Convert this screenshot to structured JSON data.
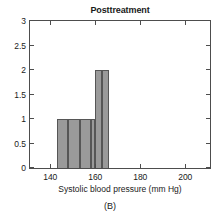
{
  "figure": {
    "panel_caption": "(B)",
    "background_color": "#ffffff",
    "axis_color": "#4d4d4d"
  },
  "chart_data": {
    "type": "bar",
    "title": "Posttreatment",
    "subtitle": "",
    "xlabel": "Systolic blood pressure (mm Hg)",
    "ylabel": "",
    "xlim": [
      131,
      211
    ],
    "ylim": [
      0,
      3
    ],
    "grid": false,
    "legend": null,
    "bar_fill_color": "#9a9a9a",
    "bar_edge_color": "#565656",
    "bin_width": 5,
    "xticks": [
      140,
      160,
      180,
      200
    ],
    "xtick_labels": [
      "140",
      "160",
      "180",
      "200"
    ],
    "yticks": [
      0,
      0.5,
      1,
      1.5,
      2,
      2.5,
      3
    ],
    "ytick_labels": [
      "0",
      "0.5",
      "1",
      "1.5",
      "2",
      "2.5",
      "3"
    ],
    "bins": [
      {
        "start": 143,
        "end": 148,
        "count": 1
      },
      {
        "start": 148,
        "end": 153,
        "count": 1
      },
      {
        "start": 153,
        "end": 158,
        "count": 1
      },
      {
        "start": 158,
        "end": 160,
        "count": 1
      },
      {
        "start": 160,
        "end": 163,
        "count": 2
      },
      {
        "start": 163,
        "end": 166,
        "count": 2
      }
    ],
    "categories": [
      "143-148",
      "148-153",
      "153-158",
      "158-160",
      "160-163",
      "163-166"
    ],
    "values": [
      1,
      1,
      1,
      1,
      2,
      2
    ]
  }
}
